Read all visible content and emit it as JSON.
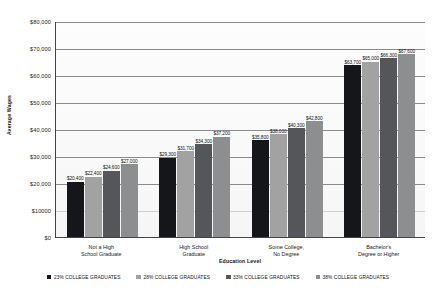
{
  "chart_data": {
    "type": "bar",
    "title": "",
    "subtitle": "",
    "xlabel": "Education Level",
    "ylabel": "Average Wages",
    "ylim": [
      0,
      80000
    ],
    "grid": true,
    "legend_position": "bottom",
    "categories": [
      "Not a High\nSchool Graduate",
      "High School\nGraduate",
      "Some College,\nNo Degree",
      "Bachelor's\nDegree or Higher"
    ],
    "category_lines": [
      [
        "Not a High",
        "School Graduate"
      ],
      [
        "High School",
        "Graduate"
      ],
      [
        "Some College,",
        "No Degree"
      ],
      [
        "Bachelor's",
        "Degree or Higher"
      ]
    ],
    "ytick_labels": [
      "$80,000",
      "$70,000",
      "$60,000",
      "$50,000",
      "$40,000",
      "$30,000",
      "$20,000",
      "$10000",
      "$0"
    ],
    "ytick_values": [
      80000,
      70000,
      60000,
      50000,
      40000,
      30000,
      20000,
      10000,
      0
    ],
    "series": [
      {
        "name": "23% COLLEGE GRADUATES",
        "color": "#15161a",
        "values": [
          20400,
          29300,
          35800,
          63700
        ],
        "value_labels": [
          "$20,400",
          "$29,300",
          "$35,800",
          "$63,700"
        ]
      },
      {
        "name": "28% COLLEGE GRADUATES",
        "color": "#a2a2a2",
        "values": [
          22400,
          31700,
          38000,
          65000
        ],
        "value_labels": [
          "$22,400",
          "$31,700",
          "$38,000",
          "$65,000"
        ]
      },
      {
        "name": "33% COLLEGE GRADUATES",
        "color": "#55565a",
        "values": [
          24600,
          34300,
          40300,
          66300
        ],
        "value_labels": [
          "$24,600",
          "$34,300",
          "$40,300",
          "$66,300"
        ]
      },
      {
        "name": "38% COLLEGE GRADUATES",
        "color": "#8d8e90",
        "values": [
          27000,
          37200,
          42800,
          67600
        ],
        "value_labels": [
          "$27,000",
          "$37,200",
          "$42,800",
          "$67,600"
        ]
      }
    ]
  }
}
